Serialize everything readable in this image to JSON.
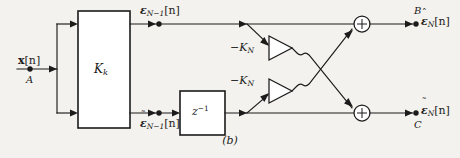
{
  "figure": {
    "caption": "(b)",
    "ink_color": "#1b1b1b",
    "paper_color": "#f4f2ee"
  },
  "input": {
    "signal_base": "x",
    "signal_index": "[n]",
    "node_label": "A"
  },
  "blocks": {
    "main_gain": {
      "base": "K",
      "sub": "k"
    },
    "delay": {
      "base": "z",
      "sup": "−1"
    }
  },
  "intermediate": {
    "top": {
      "accent": "ˆ",
      "base": "ε",
      "sub": "N−1",
      "index": "[n]"
    },
    "bottom": {
      "accent": "˜",
      "base": "ε",
      "sub": "N−1",
      "index": "[n]"
    }
  },
  "amplifiers": [
    {
      "label_sign": "−",
      "base": "K",
      "sub": "N",
      "position": "upper"
    },
    {
      "label_sign": "−",
      "base": "K",
      "sub": "N",
      "position": "lower"
    }
  ],
  "adders": [
    {
      "operator": "+",
      "position": "upper"
    },
    {
      "operator": "+",
      "position": "lower"
    }
  ],
  "outputs": {
    "top": {
      "node_label": "B",
      "accent": "ˆ",
      "base": "ε",
      "sub": "N",
      "index": "[n]"
    },
    "bottom": {
      "node_label": "C",
      "accent": "˜",
      "base": "ε",
      "sub": "N",
      "index": "[n]"
    }
  }
}
